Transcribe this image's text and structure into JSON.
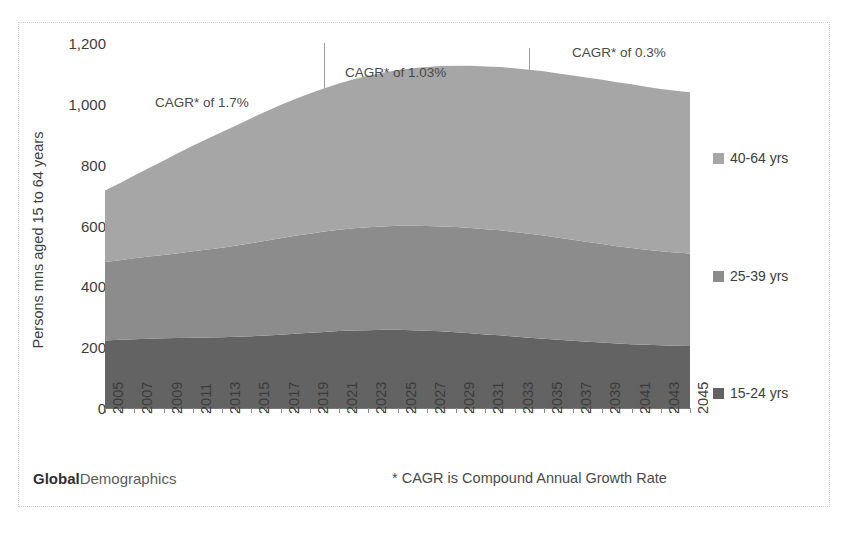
{
  "brand": {
    "part1": "Global",
    "part2": "Demographics"
  },
  "footnote": "* CAGR is Compound Annual Growth Rate",
  "axes": {
    "ylabel": "Persons mns aged 15 to 64 years",
    "yticks": [
      "0",
      "200",
      "400",
      "600",
      "800",
      "1,000",
      "1,200"
    ],
    "xticks": [
      "2005",
      "2007",
      "2009",
      "2011",
      "2013",
      "2015",
      "2017",
      "2019",
      "2021",
      "2023",
      "2025",
      "2027",
      "2029",
      "2031",
      "2033",
      "2035",
      "2037",
      "2039",
      "2041",
      "2043",
      "2045"
    ]
  },
  "legend": [
    {
      "label": "40-64 yrs",
      "color": "#a6a6a6"
    },
    {
      "label": "25-39 yrs",
      "color": "#8c8c8c"
    },
    {
      "label": "15-24 yrs",
      "color": "#636363"
    }
  ],
  "annotations": [
    {
      "text": "CAGR* of 1.7%"
    },
    {
      "text": "CAGR* of 1.03%"
    },
    {
      "text": "CAGR* of 0.3%"
    }
  ],
  "chart_data": {
    "type": "area",
    "stacked": true,
    "title": "",
    "xlabel": "",
    "ylabel": "Persons mns aged 15 to 64 years",
    "ylim": [
      0,
      1200
    ],
    "xlim": [
      2005,
      2045
    ],
    "grid": false,
    "legend_position": "right",
    "x": [
      2005,
      2006,
      2007,
      2008,
      2009,
      2010,
      2011,
      2012,
      2013,
      2014,
      2015,
      2016,
      2017,
      2018,
      2019,
      2020,
      2021,
      2022,
      2023,
      2024,
      2025,
      2026,
      2027,
      2028,
      2029,
      2030,
      2031,
      2032,
      2033,
      2034,
      2035,
      2036,
      2037,
      2038,
      2039,
      2040,
      2041,
      2042,
      2043,
      2044,
      2045
    ],
    "series": [
      {
        "name": "15-24 yrs",
        "color": "#636363",
        "values": [
          222,
          224,
          226,
          228,
          229,
          230,
          231,
          232,
          233,
          234,
          236,
          238,
          241,
          244,
          247,
          250,
          253,
          255,
          256,
          257,
          257,
          256,
          254,
          252,
          249,
          246,
          242,
          239,
          235,
          231,
          228,
          224,
          221,
          218,
          215,
          212,
          210,
          208,
          206,
          205,
          204
        ]
      },
      {
        "name": "25-39 yrs",
        "color": "#8c8c8c",
        "values": [
          258,
          262,
          266,
          270,
          274,
          279,
          284,
          289,
          294,
          300,
          306,
          312,
          317,
          322,
          326,
          330,
          333,
          336,
          338,
          340,
          342,
          343,
          344,
          345,
          346,
          346,
          346,
          345,
          344,
          342,
          339,
          336,
          332,
          328,
          324,
          320,
          316,
          312,
          309,
          306,
          304
        ]
      },
      {
        "name": "40-64 yrs",
        "color": "#a6a6a6",
        "values": [
          235,
          253,
          272,
          291,
          310,
          329,
          347,
          364,
          380,
          396,
          411,
          425,
          438,
          450,
          461,
          471,
          481,
          490,
          498,
          505,
          512,
          518,
          523,
          527,
          530,
          533,
          535,
          537,
          538,
          539,
          540,
          540,
          540,
          540,
          540,
          539,
          538,
          536,
          534,
          532,
          530
        ]
      }
    ],
    "totals": [
      715,
      739,
      764,
      789,
      813,
      838,
      862,
      885,
      907,
      930,
      953,
      975,
      996,
      1016,
      1034,
      1051,
      1067,
      1081,
      1092,
      1102,
      1111,
      1117,
      1121,
      1124,
      1125,
      1125,
      1123,
      1121,
      1117,
      1112,
      1107,
      1100,
      1093,
      1086,
      1079,
      1071,
      1064,
      1056,
      1049,
      1043,
      1038
    ],
    "period_dividers": [
      2020,
      2034
    ],
    "cagr_segments": [
      {
        "label": "CAGR* of 1.7%",
        "from": 2005,
        "to": 2020
      },
      {
        "label": "CAGR* of 1.03%",
        "from": 2020,
        "to": 2034
      },
      {
        "label": "CAGR* of 0.3%",
        "from": 2034,
        "to": 2045
      }
    ]
  }
}
